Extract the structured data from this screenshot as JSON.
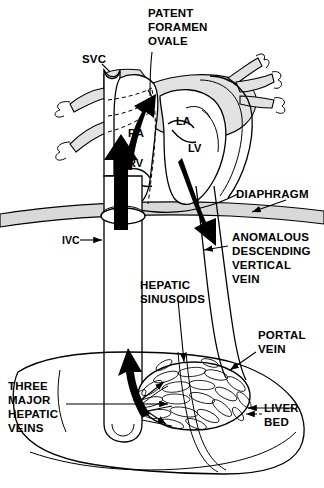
{
  "figure": {
    "type": "anatomical-diagram",
    "background_color": "#ffffff",
    "ink_color": "#000000",
    "shading_color": "#d9d9d9",
    "width": 324,
    "height": 488
  },
  "labels": {
    "patent_foramen_ovale": {
      "lines": [
        "PATENT",
        "FORAMEN",
        "OVALE"
      ],
      "x": 148,
      "y": 16
    },
    "svc": {
      "text": "SVC",
      "x": 82,
      "y": 62
    },
    "ra": {
      "text": "RA",
      "x": 128,
      "y": 136
    },
    "rv": {
      "text": "RV",
      "x": 128,
      "y": 166
    },
    "la": {
      "text": "LA",
      "x": 178,
      "y": 124
    },
    "lv": {
      "text": "LV",
      "x": 189,
      "y": 151
    },
    "diaphragm": {
      "text": "DIAPHRAGM",
      "x": 236,
      "y": 197
    },
    "ivc": {
      "text": "IVC",
      "x": 63,
      "y": 244
    },
    "anomalous_descending_vertical_vein": {
      "lines": [
        "ANOMALOUS",
        "DESCENDING",
        "VERTICAL",
        "VEIN"
      ],
      "x": 232,
      "y": 240
    },
    "hepatic_sinusoids": {
      "lines": [
        "HEPATIC",
        "SINUSOIDS"
      ],
      "x": 140,
      "y": 288
    },
    "portal_vein": {
      "lines": [
        "PORTAL",
        "VEIN"
      ],
      "x": 240,
      "y": 338
    },
    "three_major_hepatic_veins": {
      "lines": [
        "THREE",
        "MAJOR",
        "HEPATIC",
        "VEINS"
      ],
      "x": 8,
      "y": 389
    },
    "liver_bed": {
      "lines": [
        "LIVER",
        "BED"
      ],
      "x": 243,
      "y": 417
    }
  },
  "flow_arrows": [
    {
      "name": "shunt-through-foramen-ovale",
      "direction": "up-right",
      "description": "blood crossing patent foramen ovale from right atrium to left atrium"
    },
    {
      "name": "ivc-to-right-atrium",
      "direction": "up",
      "description": "inferior vena cava return into right atrium"
    },
    {
      "name": "descending-vertical-vein-flow",
      "direction": "down",
      "description": "pulmonary venous blood descending below the diaphragm"
    },
    {
      "name": "hepatic-veins-to-ivc",
      "direction": "up",
      "description": "hepatic venous drainage ascending into the inferior vena cava"
    }
  ]
}
